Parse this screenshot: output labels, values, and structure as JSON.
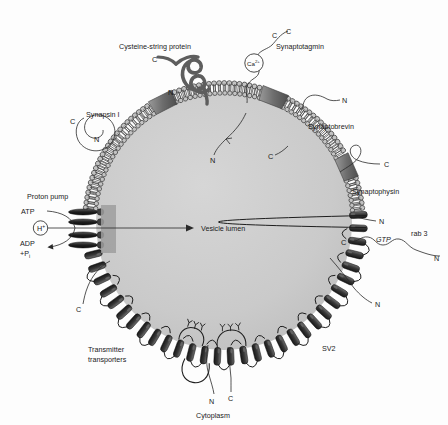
{
  "figure": {
    "lumen_label": "Vesicle lumen",
    "cytoplasm_label": "Cytoplasm",
    "background_color": "#fdfdfd",
    "lumen_color": "#c9c9c9",
    "membrane_color": "#8a8a8a",
    "protein_dark_color": "#2e2e2e",
    "line_color": "#2a2a2a"
  },
  "proteins": {
    "cysteine_string_protein": {
      "name": "Cysteine-string protein",
      "n_terminus": "N",
      "c_terminus": "C"
    },
    "synapsin": {
      "name": "Synapsin I",
      "n_terminus": "N",
      "c_terminus": "C"
    },
    "synaptotagmin": {
      "name": "Synaptotagmin",
      "c_terminus": "C",
      "ion": "Ca",
      "ion_charge": "2+",
      "lumenal_terminus": "N"
    },
    "synaptobrevin": {
      "name": "Synaptobrevin",
      "n_terminus": "N",
      "lumenal_terminus": "C"
    },
    "synaptophysin": {
      "name": "Synaptophysin",
      "c_terminus": "C",
      "n_terminus": "N"
    },
    "rab3": {
      "name": "rab 3",
      "nucleotide": "GTP",
      "c_terminus": "C",
      "n_terminus": "N"
    },
    "sv2": {
      "name": "SV2",
      "n_terminus": "N"
    },
    "transmitter_transporters": {
      "name_line1": "Transmitter",
      "name_line2": "transporters",
      "c_terminus": "C",
      "n_terminus": "N",
      "cytoplasmic_c": "C"
    },
    "proton_pump": {
      "name": "Proton pump",
      "substrate": "ATP",
      "product_line1": "ADP",
      "product_line2": "+P",
      "product_sub": "i",
      "ion": "H",
      "ion_charge": "+"
    }
  }
}
